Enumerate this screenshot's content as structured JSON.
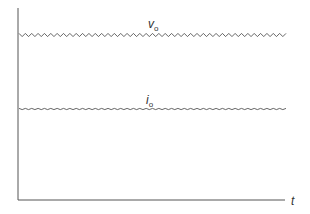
{
  "diagram": {
    "type": "waveform",
    "axes": {
      "x_label": "t",
      "y_label": ""
    },
    "waveforms": [
      {
        "name": "v",
        "subscript": "o",
        "description": "output voltage with ripple",
        "ripple": "larger",
        "ripple_cycles": 42
      },
      {
        "name": "i",
        "subscript": "o",
        "description": "output current with small ripple",
        "ripple": "smaller",
        "ripple_cycles": 42
      }
    ],
    "colors": {
      "line": "#555555",
      "axis": "#555555"
    }
  }
}
